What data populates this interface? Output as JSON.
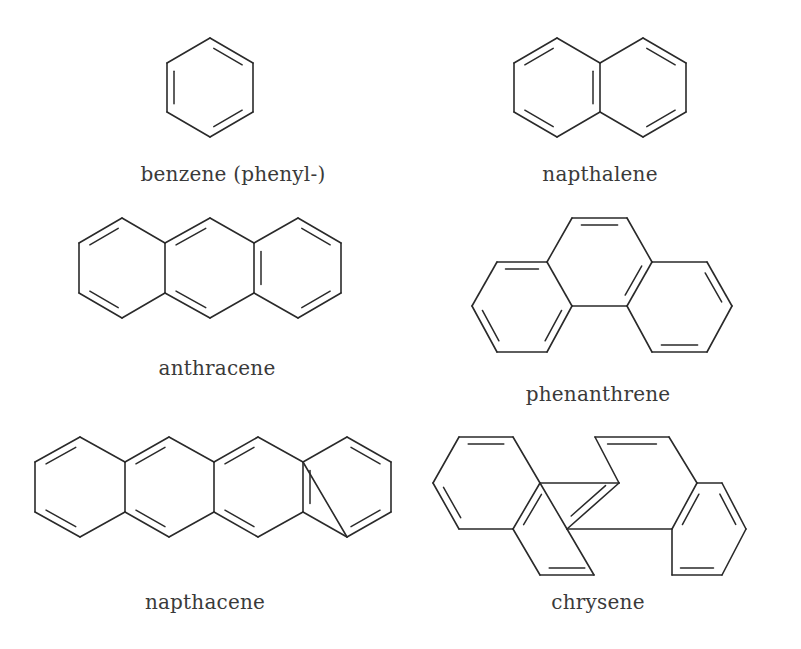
{
  "molecules": [
    {
      "id": "benzene",
      "label": "benzene (phenyl-)",
      "label_pos": [
        233,
        176
      ],
      "atoms": [
        [
          210,
          38
        ],
        [
          253,
          63
        ],
        [
          253,
          112
        ],
        [
          210,
          137
        ],
        [
          167,
          112
        ],
        [
          167,
          63
        ]
      ],
      "bonds": [
        [
          0,
          1,
          2
        ],
        [
          1,
          2,
          1
        ],
        [
          2,
          3,
          2
        ],
        [
          3,
          4,
          1
        ],
        [
          4,
          5,
          2
        ],
        [
          5,
          0,
          1
        ]
      ],
      "rings": [
        [
          0,
          1,
          2,
          3,
          4,
          5
        ]
      ]
    },
    {
      "id": "napthalene",
      "label": "napthalene",
      "label_pos": [
        600,
        176
      ],
      "atoms": [
        [
          557,
          38
        ],
        [
          600,
          63
        ],
        [
          600,
          112
        ],
        [
          557,
          137
        ],
        [
          514,
          112
        ],
        [
          514,
          63
        ],
        [
          643,
          38
        ],
        [
          686,
          63
        ],
        [
          686,
          112
        ],
        [
          643,
          137
        ]
      ],
      "bonds": [
        [
          0,
          1,
          1
        ],
        [
          1,
          2,
          2
        ],
        [
          2,
          3,
          1
        ],
        [
          3,
          4,
          2
        ],
        [
          4,
          5,
          1
        ],
        [
          5,
          0,
          2
        ],
        [
          1,
          6,
          1
        ],
        [
          6,
          7,
          2
        ],
        [
          7,
          8,
          1
        ],
        [
          8,
          9,
          2
        ],
        [
          9,
          2,
          1
        ]
      ],
      "rings": [
        [
          0,
          1,
          2,
          3,
          4,
          5
        ],
        [
          1,
          6,
          7,
          8,
          9,
          2
        ]
      ]
    },
    {
      "id": "anthracene",
      "label": "anthracene",
      "label_pos": [
        217,
        370
      ],
      "atoms": [
        [
          122,
          218
        ],
        [
          165,
          243
        ],
        [
          165,
          293
        ],
        [
          122,
          318
        ],
        [
          79,
          293
        ],
        [
          79,
          243
        ],
        [
          210,
          218
        ],
        [
          254,
          243
        ],
        [
          254,
          293
        ],
        [
          210,
          318
        ],
        [
          298,
          218
        ],
        [
          341,
          243
        ],
        [
          341,
          293
        ],
        [
          298,
          318
        ]
      ],
      "bonds": [
        [
          0,
          1,
          1
        ],
        [
          1,
          2,
          1
        ],
        [
          2,
          3,
          1
        ],
        [
          3,
          4,
          2
        ],
        [
          4,
          5,
          1
        ],
        [
          5,
          0,
          2
        ],
        [
          1,
          6,
          2
        ],
        [
          6,
          7,
          1
        ],
        [
          7,
          8,
          2
        ],
        [
          8,
          9,
          1
        ],
        [
          9,
          2,
          2
        ],
        [
          7,
          10,
          1
        ],
        [
          10,
          11,
          2
        ],
        [
          11,
          12,
          1
        ],
        [
          12,
          13,
          2
        ],
        [
          13,
          8,
          1
        ]
      ],
      "rings": [
        [
          0,
          1,
          2,
          3,
          4,
          5
        ],
        [
          1,
          6,
          7,
          8,
          9,
          2
        ],
        [
          7,
          10,
          11,
          12,
          13,
          8
        ]
      ]
    },
    {
      "id": "phenanthrene",
      "label": "phenanthrene",
      "label_pos": [
        598,
        396
      ],
      "atoms": [
        [
          572,
          218
        ],
        [
          627,
          218
        ],
        [
          652,
          262
        ],
        [
          627,
          306
        ],
        [
          572,
          306
        ],
        [
          547,
          262
        ],
        [
          497,
          262
        ],
        [
          472,
          306
        ],
        [
          497,
          352
        ],
        [
          547,
          352
        ],
        [
          707,
          262
        ],
        [
          732,
          306
        ],
        [
          707,
          352
        ],
        [
          652,
          352
        ]
      ],
      "bonds": [
        [
          0,
          1,
          2
        ],
        [
          1,
          2,
          1
        ],
        [
          2,
          3,
          2
        ],
        [
          3,
          4,
          1
        ],
        [
          4,
          5,
          1
        ],
        [
          5,
          0,
          1
        ],
        [
          5,
          6,
          2
        ],
        [
          6,
          7,
          1
        ],
        [
          7,
          8,
          2
        ],
        [
          8,
          9,
          1
        ],
        [
          9,
          4,
          2
        ],
        [
          2,
          10,
          1
        ],
        [
          10,
          11,
          2
        ],
        [
          11,
          12,
          1
        ],
        [
          12,
          13,
          2
        ],
        [
          13,
          3,
          1
        ]
      ],
      "rings": [
        [
          0,
          1,
          2,
          3,
          4,
          5
        ],
        [
          5,
          6,
          7,
          8,
          9,
          4
        ],
        [
          2,
          10,
          11,
          12,
          13,
          3
        ]
      ]
    },
    {
      "id": "napthacene",
      "label": "napthacene",
      "label_pos": [
        205,
        604
      ],
      "atoms": [
        [
          80,
          437
        ],
        [
          125,
          462
        ],
        [
          125,
          512
        ],
        [
          80,
          537
        ],
        [
          35,
          512
        ],
        [
          35,
          462
        ],
        [
          169,
          437
        ],
        [
          214,
          462
        ],
        [
          214,
          512
        ],
        [
          169,
          537
        ],
        [
          258,
          437
        ],
        [
          303,
          462
        ],
        [
          303,
          512
        ],
        [
          258,
          537
        ],
        [
          347,
          437
        ],
        [
          391,
          462
        ],
        [
          391,
          512
        ],
        [
          347,
          537
        ]
      ],
      "bonds": [
        [
          0,
          1,
          1
        ],
        [
          1,
          2,
          1
        ],
        [
          2,
          3,
          1
        ],
        [
          3,
          4,
          2
        ],
        [
          4,
          5,
          1
        ],
        [
          5,
          0,
          2
        ],
        [
          1,
          6,
          2
        ],
        [
          6,
          7,
          1
        ],
        [
          7,
          8,
          1
        ],
        [
          8,
          9,
          1
        ],
        [
          9,
          2,
          2
        ],
        [
          7,
          10,
          2
        ],
        [
          10,
          11,
          1
        ],
        [
          11,
          12,
          2
        ],
        [
          12,
          13,
          1
        ],
        [
          13,
          8,
          2
        ],
        [
          11,
          14,
          1
        ],
        [
          14,
          15,
          2
        ],
        [
          15,
          16,
          1
        ],
        [
          16,
          17,
          2
        ],
        [
          17,
          11,
          0
        ],
        [
          17,
          12,
          1
        ]
      ],
      "rings": [
        [
          0,
          1,
          2,
          3,
          4,
          5
        ],
        [
          1,
          6,
          7,
          8,
          9,
          2
        ],
        [
          7,
          10,
          11,
          12,
          13,
          8
        ],
        [
          11,
          14,
          15,
          16,
          17,
          12
        ]
      ]
    },
    {
      "id": "chrysene",
      "label": "chrysene",
      "label_pos": [
        598,
        604
      ],
      "atoms": [
        [
          459,
          437
        ],
        [
          513,
          437
        ],
        [
          540,
          483
        ],
        [
          513,
          529
        ],
        [
          459,
          529
        ],
        [
          433,
          483
        ],
        [
          567,
          529
        ],
        [
          540,
          575
        ],
        [
          594,
          575
        ],
        [
          619,
          483
        ],
        [
          595,
          437
        ],
        [
          669,
          437
        ],
        [
          697,
          483
        ],
        [
          672,
          529
        ],
        [
          722,
          483
        ],
        [
          746,
          529
        ],
        [
          722,
          575
        ],
        [
          672,
          575
        ]
      ],
      "bonds": [
        [
          0,
          1,
          2
        ],
        [
          1,
          2,
          1
        ],
        [
          2,
          3,
          2
        ],
        [
          3,
          4,
          1
        ],
        [
          4,
          5,
          2
        ],
        [
          5,
          0,
          1
        ],
        [
          3,
          7,
          1
        ],
        [
          7,
          8,
          2
        ],
        [
          8,
          6,
          1
        ],
        [
          6,
          2,
          0
        ],
        [
          2,
          9,
          1
        ],
        [
          9,
          6,
          2
        ],
        [
          9,
          10,
          1
        ],
        [
          10,
          11,
          2
        ],
        [
          11,
          12,
          1
        ],
        [
          12,
          13,
          2
        ],
        [
          13,
          6,
          1
        ],
        [
          12,
          14,
          1
        ],
        [
          14,
          15,
          2
        ],
        [
          15,
          16,
          1
        ],
        [
          16,
          17,
          2
        ],
        [
          17,
          13,
          1
        ]
      ],
      "rings": [
        [
          0,
          1,
          2,
          3,
          4,
          5
        ],
        [
          2,
          9,
          6,
          8,
          7,
          3
        ],
        [
          9,
          10,
          11,
          12,
          13,
          6
        ],
        [
          12,
          14,
          15,
          16,
          17,
          13
        ]
      ]
    }
  ]
}
